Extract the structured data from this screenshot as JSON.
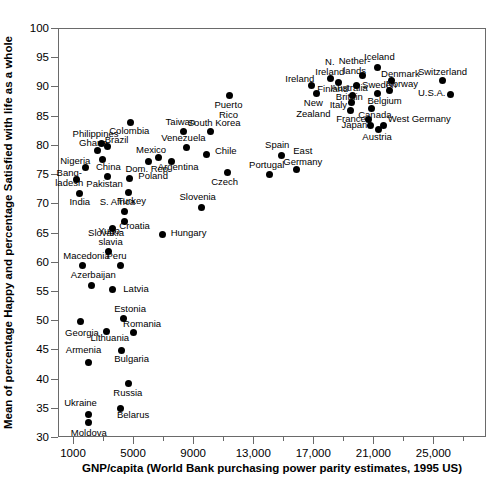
{
  "chart_data": {
    "type": "scatter",
    "title": "",
    "xlabel": "GNP/capita (World Bank purchasing power parity estimates, 1995 US)",
    "ylabel": "Mean of percentage Happy and percentage Satisfied with life as a whole",
    "xlim": [
      0,
      28500
    ],
    "ylim": [
      30,
      100
    ],
    "grid": false,
    "legend": "none",
    "xticks_major": [
      "1000",
      "5000",
      "9000",
      "13,000",
      "17,000",
      "21,000",
      "25,000"
    ],
    "xticks_major_values": [
      1000,
      5000,
      9000,
      13000,
      17000,
      21000,
      25000
    ],
    "xticks_minor_values": [
      3000,
      7000,
      11000,
      15000,
      19000,
      23000,
      27000
    ],
    "yticks": [
      "30",
      "35",
      "40",
      "45",
      "50",
      "55",
      "60",
      "65",
      "70",
      "75",
      "80",
      "85",
      "90",
      "95",
      "100"
    ],
    "yticks_values": [
      30,
      35,
      40,
      45,
      50,
      55,
      60,
      65,
      70,
      75,
      80,
      85,
      90,
      95,
      100
    ],
    "points": [
      {
        "label": "Moldova",
        "x": 2000,
        "y": 32.4,
        "lx": 2050,
        "ly": 30.6,
        "align": "c"
      },
      {
        "label": "Ukraine",
        "x": 2050,
        "y": 33.9,
        "lx": 1500,
        "ly": 35.8,
        "align": "c"
      },
      {
        "label": "Belarus",
        "x": 4150,
        "y": 34.9,
        "lx": 5000,
        "ly": 33.7,
        "align": "c"
      },
      {
        "label": "Russia",
        "x": 4700,
        "y": 39.2,
        "lx": 4650,
        "ly": 37.5,
        "align": "c"
      },
      {
        "label": "Armenia",
        "x": 2050,
        "y": 42.8,
        "lx": 1700,
        "ly": 44.9,
        "align": "c"
      },
      {
        "label": "Bulgaria",
        "x": 4200,
        "y": 44.8,
        "lx": 4900,
        "ly": 43.4,
        "align": "c"
      },
      {
        "label": "Lithuania",
        "x": 3200,
        "y": 48.1,
        "lx": 3450,
        "ly": 46.9,
        "align": "c"
      },
      {
        "label": "Georgia",
        "x": 1500,
        "y": 49.8,
        "lx": 1600,
        "ly": 47.8,
        "align": "c"
      },
      {
        "label": "Romania",
        "x": 5000,
        "y": 47.9,
        "lx": 5600,
        "ly": 49.4,
        "align": "c"
      },
      {
        "label": "Estonia",
        "x": 4350,
        "y": 50.2,
        "lx": 4800,
        "ly": 51.9,
        "align": "c"
      },
      {
        "label": "Latvia",
        "x": 3650,
        "y": 55.3,
        "lx": 4350,
        "ly": 55.4,
        "align": "l"
      },
      {
        "label": "Azerbaijan",
        "x": 2200,
        "y": 55.9,
        "lx": 2350,
        "ly": 57.7,
        "align": "c"
      },
      {
        "label": "Macedonia",
        "x": 1600,
        "y": 59.3,
        "lx": 1900,
        "ly": 61.0,
        "align": "c"
      },
      {
        "label": "Peru",
        "x": 4150,
        "y": 59.4,
        "lx": 3900,
        "ly": 60.9,
        "align": "c"
      },
      {
        "label": "Yugoslavia",
        "x": 3350,
        "y": 61.7,
        "lx": 3500,
        "ly": 65.2,
        "align": "c"
      },
      {
        "label": "Hungary",
        "x": 6950,
        "y": 64.6,
        "lx": 7500,
        "ly": 65.0,
        "align": "l"
      },
      {
        "label": "Slovakia",
        "x": 3650,
        "y": 65.7,
        "lx": 3200,
        "ly": 64.9,
        "align": "c"
      },
      {
        "label": "Croatia",
        "x": 4400,
        "y": 66.8,
        "lx": 5100,
        "ly": 66.1,
        "align": "c"
      },
      {
        "label": "S. Africa",
        "x": 4400,
        "y": 68.6,
        "lx": 3950,
        "ly": 70.2,
        "align": "c"
      },
      {
        "label": "India",
        "x": 1400,
        "y": 71.7,
        "lx": 1450,
        "ly": 70.2,
        "align": "c"
      },
      {
        "label": "Slovenia",
        "x": 9550,
        "y": 69.2,
        "lx": 9300,
        "ly": 71.0,
        "align": "c"
      },
      {
        "label": "Turkey",
        "x": 4700,
        "y": 71.8,
        "lx": 4900,
        "ly": 70.4,
        "align": "c"
      },
      {
        "label": "Bangladesh",
        "x": 1250,
        "y": 74.1,
        "lx": 750,
        "ly": 75.2,
        "align": "c"
      },
      {
        "label": "Poland",
        "x": 4750,
        "y": 74.2,
        "lx": 5350,
        "ly": 74.6,
        "align": "l"
      },
      {
        "label": "Pakistan",
        "x": 3300,
        "y": 74.6,
        "lx": 3100,
        "ly": 73.3,
        "align": "c"
      },
      {
        "label": "Portugal",
        "x": 14100,
        "y": 74.9,
        "lx": 13900,
        "ly": 76.5,
        "align": "c"
      },
      {
        "label": "Czech",
        "x": 11300,
        "y": 75.2,
        "lx": 11100,
        "ly": 73.6,
        "align": "c"
      },
      {
        "label": "Nigeria",
        "x": 1850,
        "y": 76.1,
        "lx": 1150,
        "ly": 77.2,
        "align": "c"
      },
      {
        "label": "East Germany",
        "x": 15900,
        "y": 75.8,
        "lx": 16300,
        "ly": 78.9,
        "align": "c"
      },
      {
        "label": "Spain",
        "x": 14900,
        "y": 78.2,
        "lx": 14600,
        "ly": 79.9,
        "align": "c"
      },
      {
        "label": "Dom. Rep.",
        "x": 6000,
        "y": 77.2,
        "lx": 6000,
        "ly": 75.9,
        "align": "c"
      },
      {
        "label": "China",
        "x": 2950,
        "y": 77.5,
        "lx": 3350,
        "ly": 76.2,
        "align": "c"
      },
      {
        "label": "Argentina",
        "x": 7550,
        "y": 77.1,
        "lx": 8000,
        "ly": 76.2,
        "align": "c"
      },
      {
        "label": "Mexico",
        "x": 6700,
        "y": 77.9,
        "lx": 6200,
        "ly": 79.1,
        "align": "c"
      },
      {
        "label": "Chile",
        "x": 9900,
        "y": 78.4,
        "lx": 10450,
        "ly": 79.0,
        "align": "l"
      },
      {
        "label": "Ghana",
        "x": 2600,
        "y": 79.1,
        "lx": 2350,
        "ly": 80.4,
        "align": "c"
      },
      {
        "label": "Venezuela",
        "x": 8550,
        "y": 79.6,
        "lx": 8350,
        "ly": 81.2,
        "align": "c"
      },
      {
        "label": "Brazil",
        "x": 3300,
        "y": 79.7,
        "lx": 3900,
        "ly": 80.9,
        "align": "c"
      },
      {
        "label": "Philippines",
        "x": 2900,
        "y": 80.3,
        "lx": 2500,
        "ly": 81.8,
        "align": "c"
      },
      {
        "label": "Colombia",
        "x": 4800,
        "y": 83.9,
        "lx": 4750,
        "ly": 82.3,
        "align": "c"
      },
      {
        "label": "Taiwan",
        "x": 8350,
        "y": 82.3,
        "lx": 8150,
        "ly": 83.9,
        "align": "c"
      },
      {
        "label": "South Korea",
        "x": 10150,
        "y": 82.3,
        "lx": 10400,
        "ly": 83.7,
        "align": "c"
      },
      {
        "label": "Puerto Rico",
        "x": 11450,
        "y": 88.5,
        "lx": 11350,
        "ly": 86.9,
        "align": "c"
      },
      {
        "label": "New Zealand",
        "x": 17200,
        "y": 88.8,
        "lx": 17000,
        "ly": 87.1,
        "align": "c"
      },
      {
        "label": "Ireland",
        "x": 16850,
        "y": 90.1,
        "lx": 16100,
        "ly": 91.2,
        "align": "c"
      },
      {
        "label": "N. Ireland",
        "x": 18150,
        "y": 91.3,
        "lx": 18100,
        "ly": 94.2,
        "align": "c"
      },
      {
        "label": "Finland",
        "x": 18650,
        "y": 90.7,
        "lx": 18300,
        "ly": 89.5,
        "align": "c"
      },
      {
        "label": "Italy",
        "x": 19500,
        "y": 85.8,
        "lx": 19250,
        "ly": 86.9,
        "align": "r"
      },
      {
        "label": "Britain",
        "x": 19550,
        "y": 87.2,
        "lx": 19400,
        "ly": 88.2,
        "align": "c"
      },
      {
        "label": "Australia",
        "x": 19600,
        "y": 88.5,
        "lx": 19400,
        "ly": 89.7,
        "align": "c"
      },
      {
        "label": "Sweden",
        "x": 19900,
        "y": 90.2,
        "lx": 20250,
        "ly": 90.3,
        "align": "l"
      },
      {
        "label": "Netherlands",
        "x": 20300,
        "y": 91.8,
        "lx": 19750,
        "ly": 94.4,
        "align": "c"
      },
      {
        "label": "Iceland",
        "x": 21250,
        "y": 93.3,
        "lx": 21400,
        "ly": 95.0,
        "align": "c"
      },
      {
        "label": "Denmark",
        "x": 22200,
        "y": 91.1,
        "lx": 22800,
        "ly": 92.2,
        "align": "c"
      },
      {
        "label": "France",
        "x": 20700,
        "y": 84.4,
        "lx": 20500,
        "ly": 84.5,
        "align": "r"
      },
      {
        "label": "Japan",
        "x": 20800,
        "y": 83.3,
        "lx": 20600,
        "ly": 83.4,
        "align": "r"
      },
      {
        "label": "Canada",
        "x": 20900,
        "y": 86.2,
        "lx": 21100,
        "ly": 85.1,
        "align": "c"
      },
      {
        "label": "West Germany",
        "x": 21700,
        "y": 83.3,
        "lx": 21950,
        "ly": 84.4,
        "align": "l"
      },
      {
        "label": "Austria",
        "x": 21350,
        "y": 82.6,
        "lx": 21250,
        "ly": 81.3,
        "align": "c"
      },
      {
        "label": "Belgium",
        "x": 21300,
        "y": 88.8,
        "lx": 21750,
        "ly": 87.5,
        "align": "c"
      },
      {
        "label": "Norway",
        "x": 22100,
        "y": 89.3,
        "lx": 22900,
        "ly": 90.4,
        "align": "c"
      },
      {
        "label": "Switzerland",
        "x": 25600,
        "y": 91.0,
        "lx": 25600,
        "ly": 92.4,
        "align": "c"
      },
      {
        "label": "U.S.A.",
        "x": 26150,
        "y": 88.6,
        "lx": 25800,
        "ly": 88.8,
        "align": "r"
      }
    ]
  }
}
